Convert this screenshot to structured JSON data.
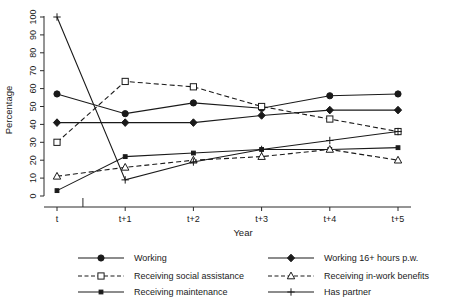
{
  "chart_data": {
    "type": "line",
    "title": "",
    "xlabel": "Year",
    "ylabel": "Percentage",
    "categories": [
      "t",
      "t+1",
      "t+2",
      "t+3",
      "t+4",
      "t+5"
    ],
    "ylim": [
      0,
      100
    ],
    "yticks": [
      0,
      10,
      20,
      30,
      40,
      50,
      60,
      70,
      80,
      90,
      100
    ],
    "grid": false,
    "legend_position": "bottom",
    "series": [
      {
        "name": "Working",
        "marker": "filled-circle",
        "linestyle": "solid",
        "values": [
          57,
          46,
          52,
          49,
          56,
          57
        ]
      },
      {
        "name": "Receiving social assistance",
        "marker": "open-square",
        "linestyle": "dashed",
        "values": [
          30,
          64,
          61,
          50,
          43,
          36
        ]
      },
      {
        "name": "Receiving maintenance",
        "marker": "small-square",
        "linestyle": "solid",
        "values": [
          3,
          22,
          24,
          26,
          26,
          27
        ]
      },
      {
        "name": "Working 16+ hours p.w.",
        "marker": "filled-diamond",
        "linestyle": "solid",
        "values": [
          41,
          41,
          41,
          45,
          48,
          48
        ]
      },
      {
        "name": "Receiving in-work benefits",
        "marker": "open-triangle",
        "linestyle": "dashed",
        "values": [
          11,
          16,
          20,
          22,
          26,
          20
        ]
      },
      {
        "name": "Has partner",
        "marker": "plus",
        "linestyle": "solid",
        "values": [
          100,
          9,
          19,
          26,
          31,
          36
        ]
      }
    ]
  },
  "axes": {
    "y_title": "Percentage",
    "x_title": "Year",
    "y_tick_labels": [
      "0",
      "10",
      "20",
      "30",
      "40",
      "50",
      "60",
      "70",
      "80",
      "90",
      "100"
    ],
    "x_tick_labels": [
      "t",
      "t+1",
      "t+2",
      "t+3",
      "t+4",
      "t+5"
    ]
  },
  "legend": {
    "entries": [
      {
        "label": "Working",
        "marker": "filled-circle",
        "linestyle": "solid"
      },
      {
        "label": "Working 16+ hours p.w.",
        "marker": "filled-diamond",
        "linestyle": "solid"
      },
      {
        "label": "Receiving social assistance",
        "marker": "open-square",
        "linestyle": "dashed"
      },
      {
        "label": "Receiving in-work benefits",
        "marker": "open-triangle",
        "linestyle": "dashed"
      },
      {
        "label": "Receiving maintenance",
        "marker": "small-square",
        "linestyle": "solid"
      },
      {
        "label": "Has partner",
        "marker": "plus",
        "linestyle": "solid"
      }
    ]
  },
  "colors": {
    "ink": "#1a1a1a",
    "axis": "#2b2b2b",
    "background": "#ffffff"
  }
}
